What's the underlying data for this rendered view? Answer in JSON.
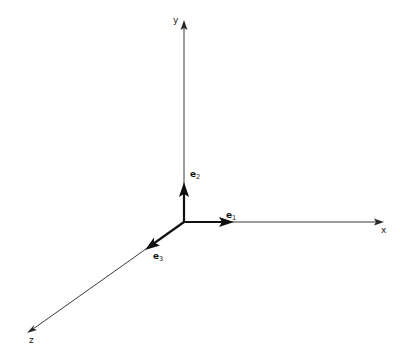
{
  "diagram": {
    "title": "",
    "type": "3d-coordinate-axes",
    "origin": [
      184,
      222
    ],
    "colors": {
      "axis": "#3a3a3a",
      "basis_vector": "#111111",
      "background": "#ffffff"
    },
    "axes": {
      "x": {
        "label": "x",
        "tip": [
          384,
          222
        ]
      },
      "y": {
        "label": "y",
        "tip": [
          184,
          20
        ]
      },
      "z": {
        "label": "z",
        "tip": [
          27,
          333
        ]
      }
    },
    "basis_vectors": {
      "e1": {
        "symbol": "e",
        "subscript": "1",
        "tip": [
          234,
          222
        ]
      },
      "e2": {
        "symbol": "e",
        "subscript": "2",
        "tip": [
          184,
          182
        ]
      },
      "e3": {
        "symbol": "e",
        "subscript": "3",
        "tip": [
          145,
          250
        ]
      }
    }
  }
}
